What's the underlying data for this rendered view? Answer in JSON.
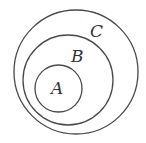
{
  "diagram": {
    "type": "nested-sets",
    "sets": [
      {
        "label": "C",
        "cx": 76,
        "cy": 72,
        "r": 62,
        "label_x": 92,
        "label_y": 37
      },
      {
        "label": "B",
        "cx": 68,
        "cy": 80,
        "r": 45,
        "label_x": 72,
        "label_y": 62
      },
      {
        "label": "A",
        "cx": 58.5,
        "cy": 88.5,
        "r": 23.5,
        "label_x": 51,
        "label_y": 94
      }
    ],
    "colors": {
      "stroke": "#4a4a4a",
      "text": "#333333",
      "background": "#ffffff"
    }
  }
}
